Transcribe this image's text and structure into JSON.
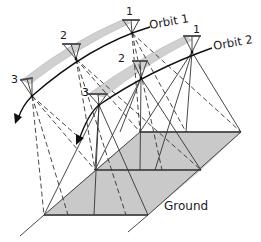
{
  "diagram": {
    "type": "satellite-orbit-ground-coverage",
    "colors": {
      "line": "#2a2a2a",
      "band": "#c8c8c8",
      "band_edge": "#555555",
      "swath_path": "#cfcfcf",
      "background": "#ffffff"
    },
    "labels": {
      "orbit1": "Orbit 1",
      "orbit2": "Orbit 2",
      "ground": "Ground"
    },
    "orbit1": {
      "satellites": [
        {
          "id": "1",
          "label": "1"
        },
        {
          "id": "2",
          "label": "2"
        },
        {
          "id": "3",
          "label": "3"
        }
      ]
    },
    "orbit2": {
      "satellites": [
        {
          "id": "1",
          "label": "1"
        },
        {
          "id": "2",
          "label": "2"
        },
        {
          "id": "3",
          "label": "3"
        }
      ]
    }
  }
}
